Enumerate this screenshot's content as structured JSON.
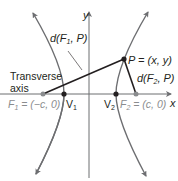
{
  "diagram": {
    "axes": {
      "x_label": "x",
      "y_label": "y"
    },
    "labels": {
      "d_f1_p": "d(F",
      "d_f1_p_sub": "1",
      "d_f1_p_end": ", P)",
      "d_f2_p": "d(F",
      "d_f2_p_sub": "2",
      "d_f2_p_end": ", P)",
      "point_p": "P = (x, y)",
      "transverse_line1": "Transverse",
      "transverse_line2": "axis",
      "f1": "F",
      "f1_sub": "1",
      "f1_value": " = (−c, 0)",
      "f2": "F",
      "f2_sub": "2",
      "f2_value": " = (c, 0)",
      "v1": "V",
      "v1_sub": "1",
      "v2": "V",
      "v2_sub": "2"
    },
    "colors": {
      "curve": "#6d6e71",
      "axis": "#6d6e71",
      "segment": "#231f20",
      "focus": "#8a8c8e",
      "text": "#231f20"
    }
  }
}
